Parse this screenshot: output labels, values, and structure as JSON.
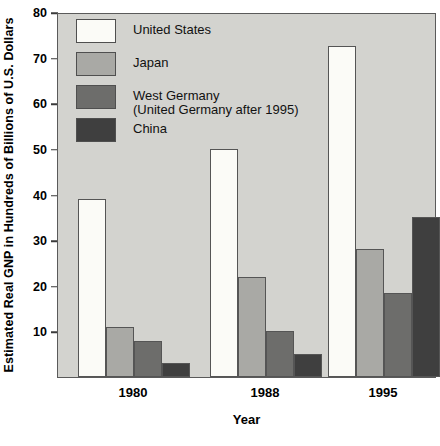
{
  "chart_data": {
    "type": "bar",
    "title": "",
    "xlabel": "Year",
    "ylabel": "Estimated Real GNP in Hundreds of Billions of U.S. Dollars",
    "categories": [
      "1980",
      "1988",
      "1995"
    ],
    "series": [
      {
        "name": "United States",
        "values": [
          39,
          50,
          72.5
        ],
        "color": "#fbfbf7"
      },
      {
        "name": "Japan",
        "values": [
          11,
          22,
          28
        ],
        "color": "#a9a9a5"
      },
      {
        "name": "West Germany\n(United Germany after 1995)",
        "values": [
          8,
          10,
          18.5
        ],
        "color": "#6d6d6b"
      },
      {
        "name": "China",
        "values": [
          3,
          5,
          35
        ],
        "color": "#3f3f3f"
      }
    ],
    "ylim": [
      0,
      80
    ],
    "yticks": [
      10,
      20,
      30,
      40,
      50,
      60,
      70,
      80
    ],
    "ytick_labels": [
      "10",
      "20",
      "30",
      "40",
      "50",
      "60",
      "70",
      "80"
    ],
    "grid": false,
    "legend_position": "upper-left",
    "plot_background": "#d3d3cf",
    "axis_color": "#5a5a5a"
  },
  "legend": {
    "items": [
      {
        "label": "United States"
      },
      {
        "label": "Japan"
      },
      {
        "label": "West Germany\n(United Germany after 1995)"
      },
      {
        "label": "China"
      }
    ]
  },
  "axes": {
    "x_title": "Year",
    "y_title": "Estimated Real GNP in Hundreds of Billions of U.S. Dollars",
    "x_tick_labels": [
      "1980",
      "1988",
      "1995"
    ],
    "y_tick_labels": [
      "80",
      "70",
      "60",
      "50",
      "40",
      "30",
      "20",
      "10"
    ]
  }
}
